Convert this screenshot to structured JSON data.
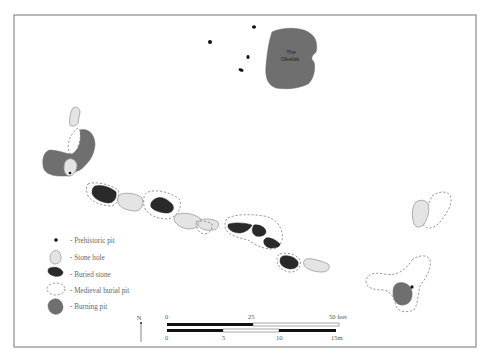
{
  "diagram": {
    "type": "archaeological site plan",
    "colors": {
      "frame": "#8a8a8a",
      "stone_hole_fill": "#e4e4e4",
      "buried_stone_fill": "#2a2a2a",
      "burning_pit_fill": "#6f6f6f",
      "medieval_pit_stroke": "#8c8c8c",
      "prehistoric_pit_fill": "#111111"
    },
    "landmark": {
      "line1": "The",
      "line2": "Obelisk"
    },
    "legend": {
      "items": [
        {
          "symbol": "prehistoric-pit",
          "label": "- Prehistoric pit"
        },
        {
          "symbol": "stone-hole",
          "label": "- Stone hole"
        },
        {
          "symbol": "buried-stone",
          "label": "- Buried stone"
        },
        {
          "symbol": "medieval-burial-pit",
          "label": "- Medieval burial pit"
        },
        {
          "symbol": "burning-pit",
          "label": "- Burning pit"
        }
      ]
    },
    "north_arrow": {
      "label": "N"
    },
    "scale_bar": {
      "feet": {
        "ticks": [
          "0",
          "25",
          "50 feet"
        ]
      },
      "metres": {
        "ticks": [
          "0",
          "5",
          "10",
          "15m"
        ]
      }
    }
  }
}
